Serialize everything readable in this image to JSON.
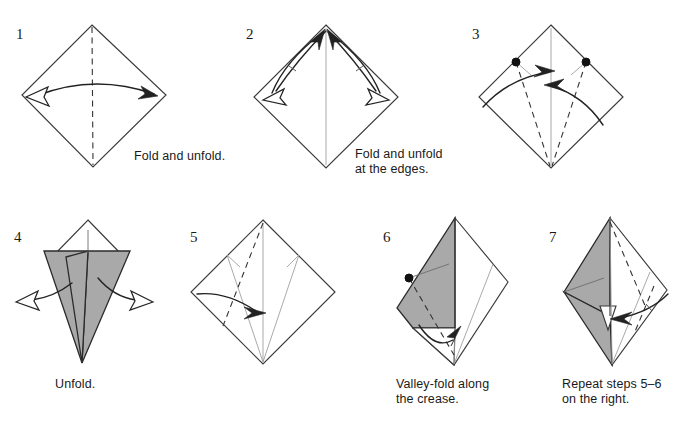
{
  "figure": {
    "type": "origami-instruction-diagram",
    "title": "",
    "width": 682,
    "height": 441,
    "background_color": "#ffffff",
    "line_color": "#3a3a3a",
    "shaded_face_color": "#a9a9a9",
    "crease_color": "#9a9a9a",
    "arrow_color": "#222222",
    "rows": 2,
    "steps_in_row_1": 3,
    "steps_in_row_2": 4
  },
  "steps": [
    {
      "number": "1",
      "caption": "Fold and unfold.",
      "shape": "square rotated 45 degrees (diamond)",
      "creases": [
        "vertical valley fold from top vertex to bottom vertex"
      ],
      "arrows": [
        "double-headed horizontal arc from left vertex to right vertex"
      ],
      "shaded": false
    },
    {
      "number": "2",
      "caption": "Fold and unfold\nat the edges.",
      "shape": "diamond with vertical center crease",
      "creases": [
        "vertical center crease"
      ],
      "arrows": [
        "arc from left vertex up to top vertex with return hollow arrow",
        "arc from right vertex up to top vertex with return hollow arrow"
      ],
      "shaded": false
    },
    {
      "number": "3",
      "caption": "",
      "shape": "diamond with two reference dots on upper left and upper right edges",
      "creases": [
        "vertical center crease",
        "valley fold from left dot to bottom vertex",
        "valley fold from right dot to bottom vertex"
      ],
      "arrows": [
        "arc from left side sweeping right to center",
        "arc from right side sweeping left to center"
      ],
      "reference_dots": 2,
      "shaded": false
    },
    {
      "number": "4",
      "caption": "Unfold.",
      "shape": "narrow kite / cone form with flaps folded to the center",
      "creases": [
        "short vertical crease at top"
      ],
      "arrows": [
        "hollow arrow pointing out to the left",
        "hollow arrow pointing out to the right"
      ],
      "shaded": true
    },
    {
      "number": "5",
      "caption": "",
      "shape": "diamond with existing creases from top and bottom vertices",
      "creases": [
        "vertical center crease",
        "valley fold dashed line from top vertex down to the left",
        "existing crease lines from bottom vertex"
      ],
      "arrows": [
        "arc from left vertex sweeping right to the center"
      ],
      "shaded": false
    },
    {
      "number": "6",
      "caption": "Valley-fold along\nthe crease.",
      "shape": "diamond with left flap folded up, gray side showing",
      "creases": [
        "dashed valley fold in the gray region",
        "existing crease from bottom vertex to upper right"
      ],
      "arrows": [
        "curved arrow rotating the lower flap upward"
      ],
      "reference_dots": 1,
      "shaded": true
    },
    {
      "number": "7",
      "caption": "Repeat steps 5–6\non the right.",
      "shape": "narrow form with gray left flap and white right flap",
      "creases": [
        "dashed valley folds on the right side",
        "existing creases from top and bottom vertices"
      ],
      "arrows": [
        "arc from the right vertex sweeping left to the center"
      ],
      "shaded": true
    }
  ],
  "captions": {
    "step1": "Fold and unfold.",
    "step2_line1": "Fold and unfold",
    "step2_line2": "at the edges.",
    "step4": "Unfold.",
    "step6_line1": "Valley-fold along",
    "step6_line2": "the crease.",
    "step7_line1": "Repeat steps 5–6",
    "step7_line2": "on the right."
  },
  "step_numbers": {
    "s1": "1",
    "s2": "2",
    "s3": "3",
    "s4": "4",
    "s5": "5",
    "s6": "6",
    "s7": "7"
  }
}
